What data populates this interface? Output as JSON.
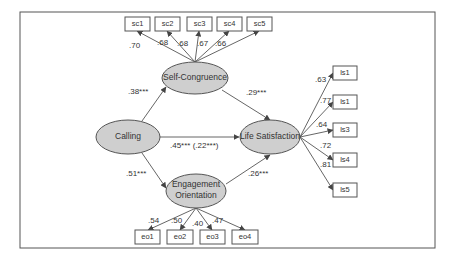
{
  "latents": {
    "calling": "Calling",
    "self_congruence": "Self-Congruence",
    "engagement_line1": "Engagement",
    "engagement_line2": "Orientation",
    "life_satisfaction": "Life Satisfaction"
  },
  "indicators": {
    "sc": [
      "sc1",
      "sc2",
      "sc3",
      "sc4",
      "sc5"
    ],
    "eo": [
      "eo1",
      "eo2",
      "eo3",
      "eo4"
    ],
    "ls": [
      "ls1",
      "ls1",
      "ls3",
      "ls4",
      "ls5"
    ]
  },
  "loadings": {
    "sc": [
      ".70",
      ".68",
      ".68",
      ".67",
      ".66"
    ],
    "eo": [
      ".54",
      ".50",
      ".40",
      ".47"
    ],
    "ls": [
      ".63",
      ".77",
      ".64",
      ".72",
      ".81"
    ]
  },
  "paths": {
    "calling_to_sc": ".38***",
    "calling_to_eo": ".51***",
    "calling_to_ls": ".45*** (.22***)",
    "sc_to_ls": ".29***",
    "eo_to_ls": ".26***"
  },
  "colors": {
    "latent_fill": "#cfcfcf",
    "stroke": "#555555",
    "text": "#333333"
  }
}
